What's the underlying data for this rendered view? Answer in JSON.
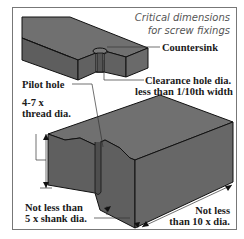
{
  "title": {
    "line1": "Critical dimensions",
    "line2": "for screw fixings"
  },
  "labels": {
    "countersink": "Countersink",
    "clearance_line1": "Clearance hole dia.",
    "clearance_line2": "less than 1/10th width",
    "pilot_hole": "Pilot hole",
    "depth_line1": "4-7 x",
    "depth_line2": "thread dia.",
    "edge_line1": "Not less than",
    "edge_line2": "5 x shank dia.",
    "end_line1": "Not less",
    "end_line2": "than 10 x dia."
  },
  "colors": {
    "block_top": "#6e6e6e",
    "block_front": "#5f5f5f",
    "block_side": "#676767",
    "outline": "#111111",
    "frame": "#777777",
    "leader": "#333333"
  }
}
